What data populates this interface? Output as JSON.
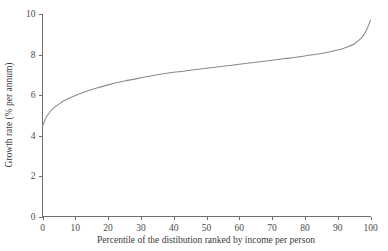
{
  "chart_data": {
    "type": "line",
    "title": "",
    "xlabel": "Percentile of the distibution ranked by income per person",
    "ylabel": "Growth rate (% per annum)",
    "xlim": [
      0,
      100
    ],
    "ylim": [
      0,
      10
    ],
    "grid": false,
    "legend": null,
    "x_ticks": [
      "0",
      "10",
      "20",
      "30",
      "40",
      "50",
      "60",
      "70",
      "80",
      "90",
      "100"
    ],
    "y_ticks": [
      "0",
      "2",
      "4",
      "6",
      "8",
      "10"
    ],
    "x_tick_values": [
      0,
      10,
      20,
      30,
      40,
      50,
      60,
      70,
      80,
      90,
      100
    ],
    "y_tick_values": [
      0,
      2,
      4,
      6,
      8,
      10
    ],
    "series": [
      {
        "name": "growth-rate-by-percentile",
        "color": "#8a8a8a",
        "x": [
          0,
          1,
          2,
          3,
          5,
          7,
          10,
          13,
          16,
          20,
          25,
          30,
          35,
          40,
          45,
          50,
          55,
          60,
          65,
          70,
          75,
          80,
          85,
          90,
          93,
          95,
          97,
          98,
          99,
          100
        ],
        "values": [
          4.45,
          4.85,
          5.1,
          5.3,
          5.55,
          5.75,
          5.98,
          6.16,
          6.32,
          6.5,
          6.69,
          6.85,
          7.0,
          7.12,
          7.22,
          7.32,
          7.42,
          7.52,
          7.62,
          7.72,
          7.82,
          7.93,
          8.05,
          8.22,
          8.38,
          8.52,
          8.78,
          8.98,
          9.28,
          9.7
        ]
      }
    ]
  },
  "axes": {
    "y_axis_label": "Growth rate (% per annum)",
    "x_axis_label": "Percentile of the distibution ranked by income per person"
  }
}
